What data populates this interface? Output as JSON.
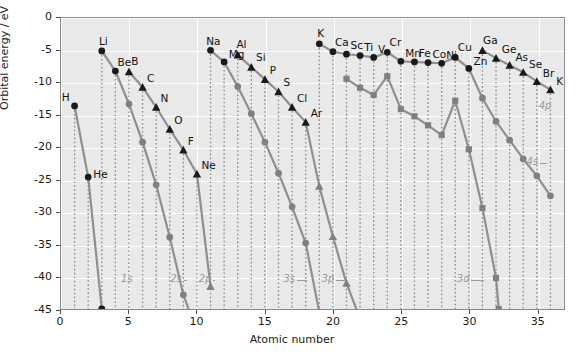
{
  "chart_data": {
    "type": "line",
    "title": "",
    "xlabel": "Atomic number",
    "ylabel": "Orbital energy / eV",
    "xlim": [
      0,
      37
    ],
    "ylim": [
      -45,
      0
    ],
    "xticks": [
      0,
      5,
      10,
      15,
      20,
      25,
      30,
      35
    ],
    "yticks": [
      0,
      -5,
      -10,
      -15,
      -20,
      -25,
      -30,
      -35,
      -40,
      -45
    ],
    "grid": true,
    "legend_position": "none",
    "marker_legend": {
      "circle": "s orbital",
      "triangle": "p orbital",
      "square": "d orbital"
    },
    "colors": {
      "plot_background": "#e9e9e9",
      "gridline": "#ffffff",
      "frame": "#8c8c8c",
      "line": "#8f8f8f",
      "marker_dark": "#1a1a1a",
      "marker_mid": "#808080",
      "leader_dotted": "#8a8a8a",
      "orbital_label": "#9a9a9a",
      "text": "#1a1a1a"
    },
    "series": [
      {
        "name": "1s",
        "marker": "circle",
        "label_x": 4.4,
        "label_y": -40.2,
        "leader_to_x": 2.35,
        "leader_to_y": -40.2,
        "points": [
          {
            "z": 1,
            "element": "H",
            "e": -13.6,
            "marker_shade": "dark",
            "label_dx": -13,
            "label_dy": -4
          },
          {
            "z": 2,
            "element": "He",
            "e": -24.6,
            "marker_shade": "dark",
            "label_dx": 5,
            "label_dy": 2
          },
          {
            "z": 3,
            "element": "",
            "e": -45.0,
            "marker_shade": "dark"
          }
        ]
      },
      {
        "name": "2s",
        "marker": "circle",
        "label_x": 8.0,
        "label_y": -40.2,
        "leader_to_x": 9.25,
        "leader_to_y": -40.2,
        "points": [
          {
            "z": 3,
            "element": "Li",
            "e": -5.1,
            "marker_shade": "dark",
            "label_dx": -3,
            "label_dy": -4
          },
          {
            "z": 4,
            "element": "Be",
            "e": -8.2,
            "marker_shade": "dark",
            "label_dx": 2,
            "label_dy": -3
          },
          {
            "z": 5,
            "element": "",
            "e": -13.3,
            "marker_shade": "mid"
          },
          {
            "z": 6,
            "element": "",
            "e": -19.2,
            "marker_shade": "mid"
          },
          {
            "z": 7,
            "element": "",
            "e": -25.8,
            "marker_shade": "mid"
          },
          {
            "z": 8,
            "element": "",
            "e": -33.9,
            "marker_shade": "mid"
          },
          {
            "z": 9,
            "element": "",
            "e": -42.8,
            "marker_shade": "mid"
          },
          {
            "z": 10,
            "element": "",
            "e": -48.5,
            "marker_shade": "mid"
          }
        ]
      },
      {
        "name": "2p",
        "marker": "triangle",
        "label_x": 10.1,
        "label_y": -40.2,
        "leader_to_x": 11.3,
        "leader_to_y": -40.2,
        "points": [
          {
            "z": 5,
            "element": "B",
            "e": -8.3,
            "marker_shade": "dark",
            "label_dx": 2,
            "label_dy": -5
          },
          {
            "z": 6,
            "element": "C",
            "e": -10.7,
            "marker_shade": "dark",
            "label_dx": 4,
            "label_dy": -4
          },
          {
            "z": 7,
            "element": "N",
            "e": -13.8,
            "marker_shade": "dark",
            "label_dx": 4,
            "label_dy": -4
          },
          {
            "z": 8,
            "element": "O",
            "e": -17.2,
            "marker_shade": "dark",
            "label_dx": 4,
            "label_dy": -4
          },
          {
            "z": 9,
            "element": "F",
            "e": -20.4,
            "marker_shade": "dark",
            "label_dx": 4,
            "label_dy": -4
          },
          {
            "z": 10,
            "element": "Ne",
            "e": -24.1,
            "marker_shade": "dark",
            "label_dx": 4,
            "label_dy": -4
          },
          {
            "z": 11,
            "element": "",
            "e": -41.5,
            "marker_shade": "mid"
          }
        ]
      },
      {
        "name": "3s",
        "marker": "circle",
        "label_x": 16.3,
        "label_y": -40.2,
        "leader_to_x": 18.0,
        "leader_to_y": -40.2,
        "points": [
          {
            "z": 11,
            "element": "Na",
            "e": -5.0,
            "marker_shade": "dark",
            "label_dx": -5,
            "label_dy": -4
          },
          {
            "z": 12,
            "element": "Mg",
            "e": -6.8,
            "marker_shade": "dark",
            "label_dx": 4,
            "label_dy": -2
          },
          {
            "z": 13,
            "element": "",
            "e": -10.6,
            "marker_shade": "mid"
          },
          {
            "z": 14,
            "element": "",
            "e": -14.8,
            "marker_shade": "mid"
          },
          {
            "z": 15,
            "element": "",
            "e": -19.2,
            "marker_shade": "mid"
          },
          {
            "z": 16,
            "element": "",
            "e": -24.0,
            "marker_shade": "mid"
          },
          {
            "z": 17,
            "element": "",
            "e": -29.2,
            "marker_shade": "mid"
          },
          {
            "z": 18,
            "element": "",
            "e": -34.8,
            "marker_shade": "mid"
          },
          {
            "z": 19,
            "element": "",
            "e": -45.5,
            "marker_shade": "mid"
          }
        ]
      },
      {
        "name": "3p",
        "marker": "triangle",
        "label_x": 19.1,
        "label_y": -40.2,
        "leader_to_x": 20.9,
        "leader_to_y": -40.2,
        "points": [
          {
            "z": 13,
            "element": "Al",
            "e": -5.7,
            "marker_shade": "dark",
            "label_dx": -2,
            "label_dy": -5
          },
          {
            "z": 14,
            "element": "Si",
            "e": -7.6,
            "marker_shade": "dark",
            "label_dx": 4,
            "label_dy": -4
          },
          {
            "z": 15,
            "element": "P",
            "e": -9.5,
            "marker_shade": "dark",
            "label_dx": 4,
            "label_dy": -4
          },
          {
            "z": 16,
            "element": "S",
            "e": -11.4,
            "marker_shade": "dark",
            "label_dx": 4,
            "label_dy": -4
          },
          {
            "z": 17,
            "element": "Cl",
            "e": -13.8,
            "marker_shade": "dark",
            "label_dx": 4,
            "label_dy": -4
          },
          {
            "z": 18,
            "element": "Ar",
            "e": -16.1,
            "marker_shade": "dark",
            "label_dx": 4,
            "label_dy": -4
          },
          {
            "z": 19,
            "element": "",
            "e": -26.0,
            "marker_shade": "mid"
          },
          {
            "z": 20,
            "element": "",
            "e": -33.8,
            "marker_shade": "mid"
          },
          {
            "z": 21,
            "element": "",
            "e": -41.0,
            "marker_shade": "mid"
          },
          {
            "z": 22,
            "element": "",
            "e": -46.5,
            "marker_shade": "mid"
          }
        ]
      },
      {
        "name": "3d",
        "marker": "square",
        "label_x": 29.0,
        "label_y": -40.2,
        "leader_to_x": 31.0,
        "leader_to_y": -40.2,
        "points": [
          {
            "z": 21,
            "element": "",
            "e": -9.4,
            "marker_shade": "mid"
          },
          {
            "z": 22,
            "element": "",
            "e": -10.8,
            "marker_shade": "mid"
          },
          {
            "z": 23,
            "element": "",
            "e": -11.9,
            "marker_shade": "mid"
          },
          {
            "z": 24,
            "element": "",
            "e": -9.0,
            "marker_shade": "mid"
          },
          {
            "z": 25,
            "element": "",
            "e": -14.1,
            "marker_shade": "mid"
          },
          {
            "z": 26,
            "element": "",
            "e": -15.2,
            "marker_shade": "mid"
          },
          {
            "z": 27,
            "element": "",
            "e": -16.6,
            "marker_shade": "mid"
          },
          {
            "z": 28,
            "element": "",
            "e": -18.1,
            "marker_shade": "mid"
          },
          {
            "z": 29,
            "element": "",
            "e": -12.8,
            "marker_shade": "mid"
          },
          {
            "z": 30,
            "element": "",
            "e": -20.3,
            "marker_shade": "mid"
          },
          {
            "z": 31,
            "element": "",
            "e": -29.4,
            "marker_shade": "mid"
          },
          {
            "z": 32,
            "element": "",
            "e": -40.2,
            "marker_shade": "mid"
          },
          {
            "z": 32.2,
            "element": "",
            "e": -45.0,
            "marker_shade": "mid"
          }
        ]
      },
      {
        "name": "4s",
        "marker": "circle",
        "label_x": 34.1,
        "label_y": -22.2,
        "leader_to_x": 35.6,
        "leader_to_y": -22.2,
        "points": [
          {
            "z": 19,
            "element": "K",
            "e": -4.0,
            "marker_shade": "dark",
            "label_dx": -3,
            "label_dy": -5
          },
          {
            "z": 20,
            "element": "Ca",
            "e": -5.2,
            "marker_shade": "dark",
            "label_dx": 1,
            "label_dy": -4
          },
          {
            "z": 21,
            "element": "Sc",
            "e": -5.6,
            "marker_shade": "dark",
            "label_dx": 3,
            "label_dy": -3
          },
          {
            "z": 22,
            "element": "Ti",
            "e": -5.8,
            "marker_shade": "dark",
            "label_dx": 3,
            "label_dy": -3
          },
          {
            "z": 23,
            "element": "V",
            "e": -6.1,
            "marker_shade": "dark",
            "label_dx": 3,
            "label_dy": -3
          },
          {
            "z": 24,
            "element": "Cr",
            "e": -5.3,
            "marker_shade": "dark",
            "label_dx": 1,
            "label_dy": -5
          },
          {
            "z": 25,
            "element": "Mn",
            "e": -6.7,
            "marker_shade": "dark",
            "label_dx": 3,
            "label_dy": -3
          },
          {
            "z": 26,
            "element": "Fe",
            "e": -6.8,
            "marker_shade": "dark",
            "label_dx": 3,
            "label_dy": -3
          },
          {
            "z": 27,
            "element": "Co",
            "e": -6.9,
            "marker_shade": "dark",
            "label_dx": 3,
            "label_dy": -3
          },
          {
            "z": 28,
            "element": "Ni",
            "e": -7.0,
            "marker_shade": "dark",
            "label_dx": 3,
            "label_dy": -3
          },
          {
            "z": 29,
            "element": "Cu",
            "e": -6.1,
            "marker_shade": "dark",
            "label_dx": 1,
            "label_dy": -5
          },
          {
            "z": 30,
            "element": "Zn",
            "e": -7.8,
            "marker_shade": "dark",
            "label_dx": 3,
            "label_dy": -2
          },
          {
            "z": 31,
            "element": "",
            "e": -12.4,
            "marker_shade": "mid"
          },
          {
            "z": 32,
            "element": "",
            "e": -16.0,
            "marker_shade": "mid"
          },
          {
            "z": 33,
            "element": "",
            "e": -18.9,
            "marker_shade": "mid"
          },
          {
            "z": 34,
            "element": "",
            "e": -21.8,
            "marker_shade": "mid"
          },
          {
            "z": 35,
            "element": "",
            "e": -24.4,
            "marker_shade": "mid"
          },
          {
            "z": 36,
            "element": "",
            "e": -27.5,
            "marker_shade": "mid"
          }
        ]
      },
      {
        "name": "4p",
        "marker": "triangle",
        "label_x": 35.0,
        "label_y": -13.6,
        "leader_to_x": 36.0,
        "leader_to_y": -12.6,
        "points": [
          {
            "z": 31,
            "element": "Ga",
            "e": -5.0,
            "marker_shade": "dark",
            "label_dx": -1,
            "label_dy": -5
          },
          {
            "z": 32,
            "element": "Ge",
            "e": -6.2,
            "marker_shade": "dark",
            "label_dx": 4,
            "label_dy": -3
          },
          {
            "z": 33,
            "element": "As",
            "e": -7.3,
            "marker_shade": "dark",
            "label_dx": 4,
            "label_dy": -3
          },
          {
            "z": 34,
            "element": "Se",
            "e": -8.4,
            "marker_shade": "dark",
            "label_dx": 4,
            "label_dy": -3
          },
          {
            "z": 35,
            "element": "Br",
            "e": -9.8,
            "marker_shade": "dark",
            "label_dx": 4,
            "label_dy": -3
          },
          {
            "z": 36,
            "element": "Kr",
            "e": -11.1,
            "marker_shade": "dark",
            "label_dx": 4,
            "label_dy": -3
          }
        ]
      }
    ],
    "orbital_labels": [
      "1s",
      "2s",
      "2p",
      "3s",
      "3p",
      "3d",
      "4s",
      "4p"
    ]
  }
}
